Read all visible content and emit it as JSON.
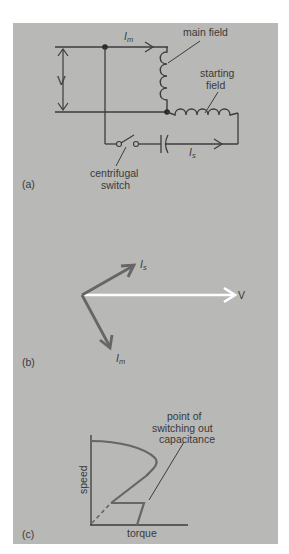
{
  "figure": {
    "background_color": "#b8b8b6",
    "page_color": "#ffffff",
    "wire_color": "#3c3c3c",
    "phasor_color": "#666666",
    "voltage_phasor_color": "#ffffff"
  },
  "panel_a": {
    "tag": "(a)",
    "voltage_label": "V",
    "main_current_label": "I",
    "main_current_sub": "m",
    "start_current_label": "I",
    "start_current_sub": "s",
    "main_field_label": "main  field",
    "starting_field_label_line1": "starting",
    "starting_field_label_line2": "field",
    "switch_label_line1": "centrifugal",
    "switch_label_line2": "switch"
  },
  "panel_b": {
    "tag": "(b)",
    "v_label": "V",
    "is_label": "I",
    "is_sub": "s",
    "im_label": "I",
    "im_sub": "m"
  },
  "panel_c": {
    "tag": "(c)",
    "xlabel": "torque",
    "ylabel": "speed",
    "annotation_line1": "point of",
    "annotation_line2": "switching  out",
    "annotation_line3": "capacitance"
  }
}
